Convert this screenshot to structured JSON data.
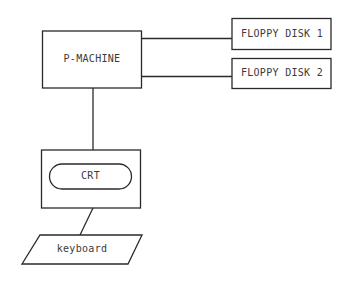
{
  "diagram": {
    "nodes": {
      "p_machine": {
        "label": "P-MACHINE"
      },
      "floppy1": {
        "label": "FLOPPY DISK 1"
      },
      "floppy2": {
        "label": "FLOPPY DISK 2"
      },
      "crt": {
        "label": "CRT"
      },
      "keyboard": {
        "label": "keyboard"
      }
    },
    "edges": [
      {
        "from": "p_machine",
        "to": "floppy1"
      },
      {
        "from": "p_machine",
        "to": "floppy2"
      },
      {
        "from": "p_machine",
        "to": "crt"
      },
      {
        "from": "crt",
        "to": "keyboard"
      }
    ],
    "colors": {
      "stroke": "#2a2a2a",
      "background": "#ffffff"
    }
  }
}
